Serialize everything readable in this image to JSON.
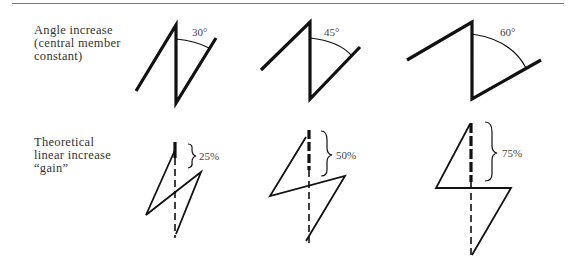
{
  "rows": [
    {
      "label_lines": [
        "Angle increase",
        "(central member",
        "constant)"
      ],
      "figures": [
        {
          "annotation": "30°"
        },
        {
          "annotation": "45°"
        },
        {
          "annotation": "60°"
        }
      ]
    },
    {
      "label_lines": [
        "Theoretical",
        "linear increase",
        "“gain”"
      ],
      "figures": [
        {
          "annotation": "25%"
        },
        {
          "annotation": "50%"
        },
        {
          "annotation": "75%"
        }
      ]
    }
  ],
  "colors": {
    "stroke": "#111111",
    "text": "#333333",
    "rule": "#777777"
  }
}
